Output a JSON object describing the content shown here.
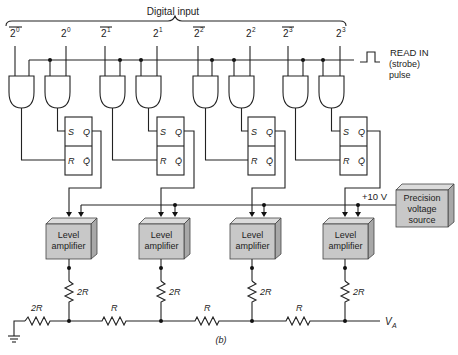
{
  "title": "Digital input",
  "inputs": [
    {
      "label": "2",
      "exp": "0",
      "inverted": true
    },
    {
      "label": "2",
      "exp": "0",
      "inverted": false
    },
    {
      "label": "2",
      "exp": "1",
      "inverted": true
    },
    {
      "label": "2",
      "exp": "1",
      "inverted": false
    },
    {
      "label": "2",
      "exp": "2",
      "inverted": true
    },
    {
      "label": "2",
      "exp": "2",
      "inverted": false
    },
    {
      "label": "2",
      "exp": "3",
      "inverted": true
    },
    {
      "label": "2",
      "exp": "3",
      "inverted": false
    }
  ],
  "strobe": {
    "line1": "READ IN",
    "line2": "(strobe)",
    "line3": "pulse"
  },
  "flipflop": {
    "s": "S",
    "q": "Q",
    "r": "R",
    "qbar": "Q̄"
  },
  "amplifier": {
    "line1": "Level",
    "line2": "amplifier"
  },
  "source": {
    "line1": "Precision",
    "line2": "voltage",
    "line3": "source",
    "voltage": "+10 V"
  },
  "ladder": {
    "vertical_resistor": "2R",
    "termination_resistor": "2R",
    "series_resistor": "R",
    "output": "V",
    "output_sub": "A"
  },
  "caption": "(b)",
  "colors": {
    "box_fill": "#c8c8c8",
    "box_top": "#dcdcdc",
    "box_side": "#a8a8a8",
    "line": "#222222"
  }
}
